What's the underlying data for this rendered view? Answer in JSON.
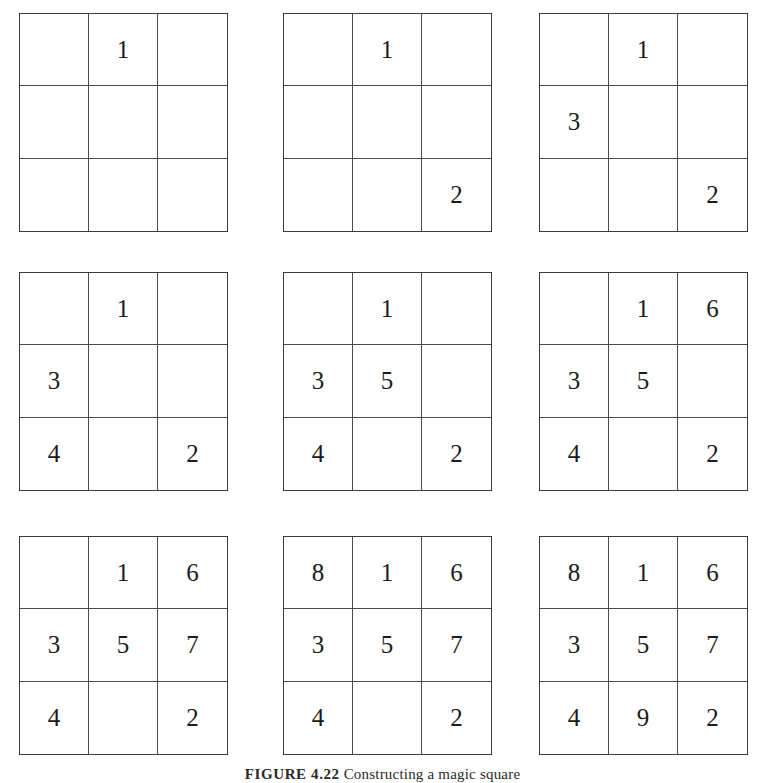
{
  "figure": {
    "label": "FIGURE 4.22",
    "text": "Constructing a magic square"
  },
  "chart_data": {
    "type": "table",
    "title": "FIGURE 4.22 Constructing a magic square",
    "layout": {
      "rows": 3,
      "columns": 3,
      "grid_size": "3x3",
      "grid_count": 9
    },
    "grids": [
      {
        "step": 1,
        "rows": [
          [
            "",
            "1",
            ""
          ],
          [
            "",
            "",
            ""
          ],
          [
            "",
            "",
            ""
          ]
        ]
      },
      {
        "step": 2,
        "rows": [
          [
            "",
            "1",
            ""
          ],
          [
            "",
            "",
            ""
          ],
          [
            "",
            "",
            "2"
          ]
        ]
      },
      {
        "step": 3,
        "rows": [
          [
            "",
            "1",
            ""
          ],
          [
            "3",
            "",
            ""
          ],
          [
            "",
            "",
            "2"
          ]
        ]
      },
      {
        "step": 4,
        "rows": [
          [
            "",
            "1",
            ""
          ],
          [
            "3",
            "",
            ""
          ],
          [
            "4",
            "",
            "2"
          ]
        ]
      },
      {
        "step": 5,
        "rows": [
          [
            "",
            "1",
            ""
          ],
          [
            "3",
            "5",
            ""
          ],
          [
            "4",
            "",
            "2"
          ]
        ]
      },
      {
        "step": 6,
        "rows": [
          [
            "",
            "1",
            "6"
          ],
          [
            "3",
            "5",
            ""
          ],
          [
            "4",
            "",
            "2"
          ]
        ]
      },
      {
        "step": 7,
        "rows": [
          [
            "",
            "1",
            "6"
          ],
          [
            "3",
            "5",
            "7"
          ],
          [
            "4",
            "",
            "2"
          ]
        ]
      },
      {
        "step": 8,
        "rows": [
          [
            "8",
            "1",
            "6"
          ],
          [
            "3",
            "5",
            "7"
          ],
          [
            "4",
            "",
            "2"
          ]
        ]
      },
      {
        "step": 9,
        "rows": [
          [
            "8",
            "1",
            "6"
          ],
          [
            "3",
            "5",
            "7"
          ],
          [
            "4",
            "9",
            "2"
          ]
        ]
      }
    ]
  }
}
